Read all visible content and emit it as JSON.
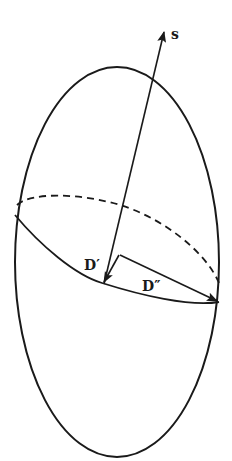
{
  "figure": {
    "stroke_color": "#1a1a1a",
    "background": "#ffffff",
    "labels": {
      "symmetry_axis": "s",
      "short_axis": "D′",
      "long_axis": "D″"
    }
  }
}
